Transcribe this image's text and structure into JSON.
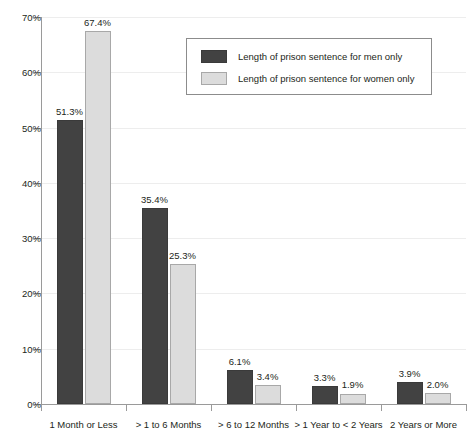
{
  "chart_data": {
    "type": "bar",
    "title": "",
    "subtitle": "",
    "xlabel": "",
    "ylabel": "",
    "ylim": [
      0,
      70
    ],
    "ytick_labels": [
      "0%",
      "10%",
      "20%",
      "30%",
      "40%",
      "50%",
      "60%",
      "70%"
    ],
    "ytick_values": [
      0,
      10,
      20,
      30,
      40,
      50,
      60,
      70
    ],
    "grid": true,
    "legend_position": "top-center",
    "categories": [
      "1 Month or Less",
      "> 1 to 6 Months",
      "> 6 to 12 Months",
      "> 1 Year to < 2 Years",
      "2 Years or More"
    ],
    "series": [
      {
        "name": "Length of prison sentence for men only",
        "color": "#424242",
        "values": [
          51.3,
          35.4,
          6.1,
          3.3,
          3.9
        ],
        "value_labels": [
          "51.3%",
          "35.4%",
          "6.1%",
          "3.3%",
          "3.9%"
        ]
      },
      {
        "name": "Length of prison sentence for women only",
        "color": "#dcdcdc",
        "values": [
          67.4,
          25.3,
          3.4,
          1.9,
          2.0
        ],
        "value_labels": [
          "67.4%",
          "25.3%",
          "3.4%",
          "1.9%",
          "2.0%"
        ]
      }
    ]
  },
  "colors": {
    "men_bar": "#424242",
    "women_bar": "#dcdcdc",
    "axis": "#9a9a9a",
    "gridline": "#ededed",
    "text": "#231f20",
    "legend_border": "#8c8c8c"
  }
}
